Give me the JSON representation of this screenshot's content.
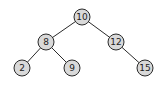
{
  "diagram": {
    "type": "binary-search-tree",
    "colors": {
      "node_fill": "#d9d9d9",
      "stroke": "#2a2a2a",
      "text": "#222222",
      "background": "#ffffff"
    },
    "nodes": [
      {
        "id": "n10",
        "label": "10",
        "x": 82,
        "y": 17
      },
      {
        "id": "n8",
        "label": "8",
        "x": 46,
        "y": 42
      },
      {
        "id": "n12",
        "label": "12",
        "x": 116,
        "y": 42
      },
      {
        "id": "n2",
        "label": "2",
        "x": 22,
        "y": 68
      },
      {
        "id": "n9",
        "label": "9",
        "x": 72,
        "y": 68
      },
      {
        "id": "n15",
        "label": "15",
        "x": 145,
        "y": 68
      }
    ],
    "edges": [
      {
        "from": "n10",
        "to": "n8"
      },
      {
        "from": "n10",
        "to": "n12"
      },
      {
        "from": "n8",
        "to": "n2"
      },
      {
        "from": "n8",
        "to": "n9"
      },
      {
        "from": "n12",
        "to": "n15"
      }
    ]
  }
}
